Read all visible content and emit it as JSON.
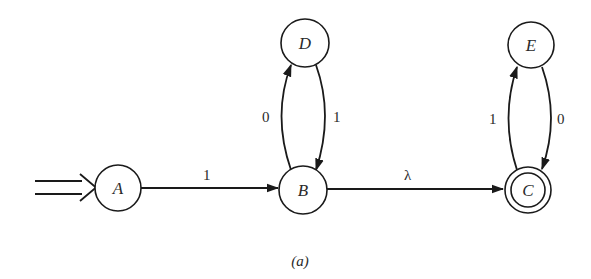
{
  "diagram": {
    "type": "finite-automaton",
    "caption": "(a)",
    "start_state": "A",
    "accepting_states": [
      "C"
    ],
    "states": [
      {
        "id": "A",
        "label": "A"
      },
      {
        "id": "B",
        "label": "B"
      },
      {
        "id": "C",
        "label": "C"
      },
      {
        "id": "D",
        "label": "D"
      },
      {
        "id": "E",
        "label": "E"
      }
    ],
    "transitions": [
      {
        "from": "A",
        "to": "B",
        "label": "1"
      },
      {
        "from": "B",
        "to": "D",
        "label": "0"
      },
      {
        "from": "D",
        "to": "B",
        "label": "1"
      },
      {
        "from": "B",
        "to": "C",
        "label": "λ"
      },
      {
        "from": "C",
        "to": "E",
        "label": "1"
      },
      {
        "from": "E",
        "to": "C",
        "label": "0"
      }
    ]
  }
}
